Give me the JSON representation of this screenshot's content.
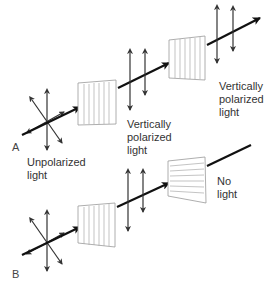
{
  "diagram": {
    "panels": [
      {
        "id": "A",
        "letter": "A",
        "labels": {
          "input": "Unpolarized\nlight",
          "after_first_filter": "Vertically\npolarized\nlight",
          "after_second_filter": "Vertically\npolarized\nlight"
        },
        "filters": [
          {
            "orientation": "vertical"
          },
          {
            "orientation": "vertical"
          }
        ]
      },
      {
        "id": "B",
        "letter": "B",
        "labels": {
          "after_second_filter": "No\nlight"
        },
        "filters": [
          {
            "orientation": "vertical"
          },
          {
            "orientation": "horizontal"
          }
        ]
      }
    ],
    "colors": {
      "beam": "#111111",
      "arrow": "#333333",
      "filter_edge": "#999999",
      "filter_line": "#aaaaaa",
      "text": "#333333"
    }
  }
}
